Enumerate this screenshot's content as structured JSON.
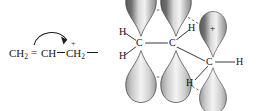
{
  "figure": {
    "background_color": "#ffffff",
    "ink_color": "#1a1a1a"
  },
  "left_structure": {
    "name": "condensed-structural-formula",
    "fragment_1": "CH",
    "fragment_1_sub": "2",
    "double_bond_symbol": "=",
    "fragment_2": "CH",
    "fragment_3": "CH",
    "fragment_3_sub": "2",
    "positive_charge": "+",
    "curved_arrow": "electron-pair-shift-arrow",
    "trailing_bond": "—"
  },
  "orbital_diagram": {
    "name": "p-orbital-delocalization-diagram",
    "carbons": [
      {
        "label": "C",
        "id": "carbon-left"
      },
      {
        "label": "C",
        "id": "carbon-middle"
      },
      {
        "label": "C",
        "id": "carbon-right"
      }
    ],
    "hydrogens": [
      {
        "label": "H",
        "id": "hydrogen-left-top"
      },
      {
        "label": "H",
        "id": "hydrogen-left-bottom"
      },
      {
        "label": "H",
        "id": "hydrogen-middle-top"
      },
      {
        "label": "H",
        "id": "hydrogen-right-side"
      },
      {
        "label": "H",
        "id": "hydrogen-right-bottom"
      }
    ],
    "empty_orbital_charge": "+",
    "lobe_count": 6,
    "dashed_overlap_lines": 4,
    "lobe_fill_dark": "#4a4a4a",
    "lobe_fill_light": "#e8e8e8",
    "lobe_outline": "#3a3a3a"
  }
}
